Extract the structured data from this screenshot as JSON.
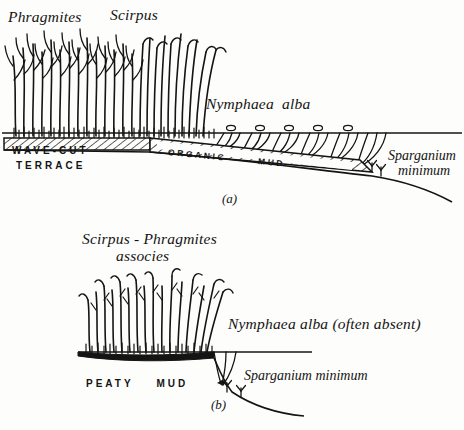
{
  "figure": {
    "ink_color": "#141414",
    "paper_color": "#fdfdfb"
  },
  "panel_a": {
    "id": "(a)",
    "labels": {
      "phragmites": "Phragmites",
      "scirpus": "Scirpus",
      "nymphaea": "Nymphaea  alba",
      "wave_cut": "WAVE-CUT",
      "terrace": "TERRACE",
      "organic": "ORGANIC",
      "mud": "MUD",
      "sparganium_line1": "Sparganium",
      "sparganium_line2": "minimum"
    }
  },
  "panel_b": {
    "id": "(b)",
    "labels": {
      "associes_line1": "Scirpus - Phragmites",
      "associes_line2": "associes",
      "nymphaea": "Nymphaea alba (often absent)",
      "peaty_mud": "PEATY    MUD",
      "sparganium": "Sparganium minimum"
    }
  }
}
